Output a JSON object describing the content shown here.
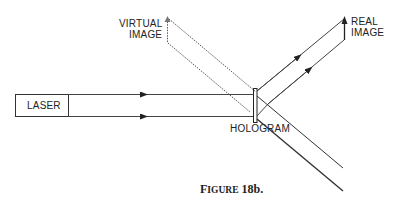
{
  "diagram": {
    "laser_label": "LASER",
    "hologram_label": "HOLOGRAM",
    "virtual_image_label": [
      "VIRTUAL",
      "IMAGE"
    ],
    "real_image_label": [
      "REAL",
      "IMAGE"
    ],
    "caption": {
      "first_letter": "F",
      "rest_smallcaps": "IGURE",
      "number": " 18b."
    }
  },
  "colors": {
    "line": "#333333",
    "background": "#ffffff"
  }
}
